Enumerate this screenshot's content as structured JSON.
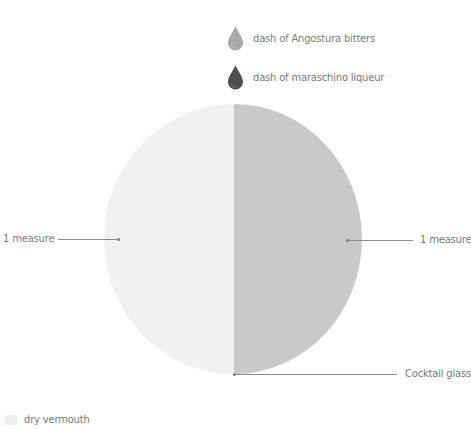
{
  "drinks": {
    "garnishes": [
      {
        "label": "dash of Angostura bitters",
        "icon": "drop-icon",
        "color": "#a9a9a9"
      },
      {
        "label": "dash of maraschino liqueur",
        "icon": "drop-icon",
        "color": "#4e4e4e"
      }
    ],
    "glass": {
      "left_label": "1 measure",
      "right_label": "1 measure",
      "left_color": "#f1f1f1",
      "right_color": "#c9c9c9",
      "glass_label": "Cocktail glass"
    },
    "legend": [
      {
        "label": "dry vermouth",
        "color": "#efefef"
      }
    ]
  }
}
